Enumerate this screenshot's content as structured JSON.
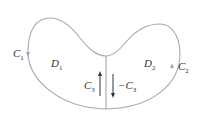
{
  "diagram": {
    "regions": [
      {
        "label": "D",
        "sub": "1"
      },
      {
        "label": "D",
        "sub": "2"
      }
    ],
    "curves": [
      {
        "label": "C",
        "sub": "1"
      },
      {
        "label": "C",
        "sub": "2"
      },
      {
        "label": "C",
        "sub": "3"
      },
      {
        "label": "−C",
        "sub": "3"
      }
    ],
    "colors": {
      "boundary": "#a8a8a8",
      "arrow": "#333333",
      "text": "#333333"
    }
  }
}
